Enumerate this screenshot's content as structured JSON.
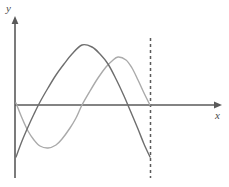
{
  "figure": {
    "width": 229,
    "height": 187,
    "background_color": "#ffffff",
    "y_axis_label": "y",
    "x_axis_label": "x"
  },
  "colors": {
    "axis": "#5a5a5a",
    "curve_dark": "#6e6e6e",
    "curve_light": "#aaaaaa",
    "dashed_line": "#5a5a5a",
    "background": "#ffffff"
  },
  "chart_data": {
    "type": "line",
    "title": "",
    "subtitle": "",
    "xlabel": "x",
    "ylabel": "y",
    "grid": false,
    "legend": null,
    "axes": {
      "origin_px": [
        15,
        105
      ],
      "x_axis_y_px": 105,
      "y_axis_x_px": 15,
      "x_axis_extent_px": [
        15,
        222
      ],
      "y_axis_extent_px": [
        178,
        16
      ],
      "x_arrow_tip_px": [
        222,
        105
      ],
      "y_arrow_tip_px": [
        15,
        16
      ]
    },
    "series": [
      {
        "name": "dark-parabola",
        "color": "#6e6e6e",
        "style": "solid",
        "width": 1.4,
        "description": "downward-opening parabola from y-axis below origin, peaking above axis, descending to endpoint at dashed line",
        "points_px": [
          [
            16,
            157
          ],
          [
            22,
            141
          ],
          [
            28,
            127
          ],
          [
            34,
            114
          ],
          [
            40,
            102
          ],
          [
            48,
            88
          ],
          [
            56,
            75
          ],
          [
            64,
            64
          ],
          [
            72,
            54
          ],
          [
            82,
            45
          ],
          [
            92,
            47
          ],
          [
            100,
            54
          ],
          [
            108,
            64
          ],
          [
            116,
            79
          ],
          [
            124,
            96
          ],
          [
            130,
            110
          ],
          [
            138,
            129
          ],
          [
            144,
            144
          ],
          [
            150,
            157
          ]
        ],
        "x_intercepts_px": [
          38,
          124
        ],
        "vertex_px": [
          82,
          45
        ],
        "start_px": [
          16,
          157
        ],
        "end_px": [
          150,
          157
        ]
      },
      {
        "name": "light-wave",
        "color": "#aaaaaa",
        "style": "solid",
        "width": 1.4,
        "description": "S-shaped wave starting near origin, dipping to a minimum, rising to a maximum, then crossing the x-axis exactly at the dashed line",
        "points_px": [
          [
            16,
            103
          ],
          [
            22,
            118
          ],
          [
            28,
            131
          ],
          [
            34,
            140
          ],
          [
            40,
            146
          ],
          [
            48,
            148
          ],
          [
            56,
            145
          ],
          [
            62,
            139
          ],
          [
            70,
            128
          ],
          [
            76,
            118
          ],
          [
            82,
            105
          ],
          [
            90,
            91
          ],
          [
            98,
            78
          ],
          [
            106,
            67
          ],
          [
            112,
            61
          ],
          [
            118,
            57
          ],
          [
            126,
            60
          ],
          [
            132,
            68
          ],
          [
            138,
            80
          ],
          [
            144,
            93
          ],
          [
            150,
            105
          ]
        ],
        "x_intercepts_px": [
          16,
          82,
          150
        ],
        "minimum_px": [
          48,
          148
        ],
        "maximum_px": [
          118,
          57
        ],
        "start_px": [
          16,
          103
        ],
        "end_px": [
          150,
          105
        ]
      }
    ],
    "annotations": [
      {
        "name": "vertical-dashed-line",
        "type": "vertical-dashed",
        "x_px": 150,
        "y_top_px": 38,
        "y_bottom_px": 178,
        "color": "#5a5a5a",
        "dash_pattern": "3 3"
      }
    ]
  }
}
